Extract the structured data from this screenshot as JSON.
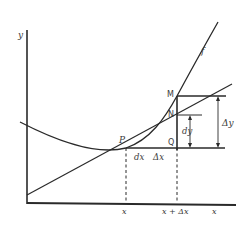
{
  "diagram": {
    "type": "differential-vs-increment",
    "colors": {
      "ink": "#2a2a2a",
      "paper": "#ffffff"
    },
    "axes": {
      "x_label": "x",
      "y_label": "y"
    },
    "curve": {
      "label": "f"
    },
    "points": {
      "P": "P",
      "Q": "Q",
      "M": "M",
      "N": "N"
    },
    "segment_labels": {
      "dx": "dx",
      "delta_x": "Δx",
      "dy": "dy",
      "delta_y": "Δy"
    },
    "tick_labels": {
      "x": "x",
      "x_plus_delta_x": "x + Δx"
    }
  }
}
